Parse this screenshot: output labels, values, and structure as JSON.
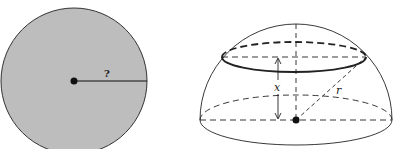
{
  "figure": {
    "left": {
      "title": "cross-section disk",
      "radius_label": "?",
      "fill_color": "#bdbdbd",
      "stroke_color": "#222222"
    },
    "right": {
      "title": "hemisphere",
      "height_label": "x",
      "radius_label": "r",
      "stroke_color": "#222222"
    }
  }
}
